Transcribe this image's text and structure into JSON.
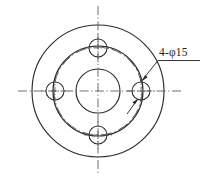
{
  "drawing": {
    "title": "flange-hole-pattern-view",
    "type": "engineering-orthographic-view",
    "background_color": "#ffffff",
    "line_color": "#2b2b2b",
    "centerline_color": "#555555",
    "canvas": {
      "width": 205,
      "height": 180
    },
    "center": {
      "x": 98,
      "y": 91
    },
    "annotations": [
      {
        "id": "hole-callout",
        "text": "4-φ15",
        "meaning": "four holes of diameter 15",
        "quantity": 4,
        "diameter": 15,
        "symbol": "φ",
        "text_position": {
          "x": 160,
          "y": 57
        },
        "leader_shelf": {
          "x1": 158,
          "y1": 60,
          "x2": 200,
          "y2": 60
        },
        "leader_line": {
          "x1": 158,
          "y1": 60,
          "x2": 140,
          "y2": 83
        },
        "arrow_target": {
          "x": 140,
          "y": 83
        }
      }
    ],
    "circles": [
      {
        "id": "outer-rim",
        "name": "outer-diameter-circle",
        "cx": 98,
        "cy": 91,
        "r": 66,
        "style": "solid"
      },
      {
        "id": "mid-rim",
        "name": "inner-body-circle",
        "cx": 98,
        "cy": 91,
        "r": 45,
        "style": "solid"
      },
      {
        "id": "center-bore",
        "name": "center-bore-circle",
        "cx": 98,
        "cy": 91,
        "r": 22,
        "style": "solid"
      },
      {
        "id": "bolt-circle",
        "name": "bolt-circle-pitch",
        "cx": 98,
        "cy": 91,
        "r": 44,
        "style": "dash-dot"
      }
    ],
    "holes": [
      {
        "id": "hole-top",
        "name": "bolt-hole-top",
        "cx": 98,
        "cy": 48,
        "r": 9
      },
      {
        "id": "hole-right",
        "name": "bolt-hole-right",
        "cx": 141,
        "cy": 91,
        "r": 9
      },
      {
        "id": "hole-bottom",
        "name": "bolt-hole-bottom",
        "cx": 98,
        "cy": 135,
        "r": 9
      },
      {
        "id": "hole-left",
        "name": "bolt-hole-left",
        "cx": 55,
        "cy": 91,
        "r": 9
      }
    ],
    "centerlines": [
      {
        "id": "axis-horizontal",
        "name": "horizontal-centerline",
        "x1": 18,
        "y1": 91,
        "x2": 182,
        "y2": 91
      },
      {
        "id": "axis-vertical",
        "name": "vertical-centerline",
        "x1": 98,
        "y1": 6,
        "x2": 98,
        "y2": 174
      }
    ]
  }
}
